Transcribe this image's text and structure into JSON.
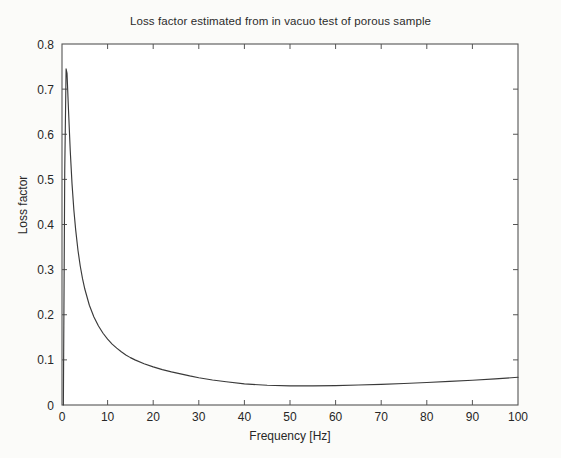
{
  "chart_data": {
    "type": "line",
    "title": "Loss factor estimated from in vacuo test of porous sample",
    "xlabel": "Frequency [Hz]",
    "ylabel": "Loss factor",
    "xlim": [
      0,
      100
    ],
    "ylim": [
      0,
      0.8
    ],
    "grid": false,
    "legend": null,
    "xticks": [
      0,
      10,
      20,
      30,
      40,
      50,
      60,
      70,
      80,
      90,
      100
    ],
    "xtick_labels": [
      "0",
      "10",
      "20",
      "30",
      "40",
      "50",
      "60",
      "70",
      "80",
      "90",
      "100"
    ],
    "yticks": [
      0,
      0.1,
      0.2,
      0.3,
      0.4,
      0.5,
      0.6,
      0.7,
      0.8
    ],
    "ytick_labels": [
      "0",
      "0.1",
      "0.2",
      "0.3",
      "0.4",
      "0.5",
      "0.6",
      "0.7",
      "0.8"
    ],
    "tick_direction": "in",
    "box": true,
    "line_color": "#3a3a3a",
    "series": [
      {
        "name": "Loss factor",
        "x": [
          0.3,
          0.6,
          0.9,
          1.1,
          1.4,
          1.8,
          2.2,
          2.6,
          3.0,
          3.5,
          4.0,
          4.5,
          5.0,
          6.0,
          7.0,
          8.0,
          9.0,
          10.0,
          11.0,
          12.0,
          13.0,
          14.0,
          15.0,
          16.0,
          18.0,
          20.0,
          22.0,
          24.0,
          26.0,
          28.0,
          30.0,
          33.0,
          36.0,
          40.0,
          45.0,
          50.0,
          55.0,
          60.0,
          65.0,
          70.0,
          75.0,
          80.0,
          85.0,
          90.0,
          95.0,
          100.0
        ],
        "y": [
          0.0,
          0.52,
          0.745,
          0.735,
          0.66,
          0.565,
          0.49,
          0.432,
          0.388,
          0.343,
          0.308,
          0.28,
          0.257,
          0.221,
          0.195,
          0.175,
          0.159,
          0.146,
          0.135,
          0.126,
          0.118,
          0.111,
          0.105,
          0.1,
          0.0915,
          0.0845,
          0.0785,
          0.0735,
          0.069,
          0.0645,
          0.0605,
          0.0555,
          0.0515,
          0.0468,
          0.0438,
          0.0425,
          0.0424,
          0.043,
          0.0442,
          0.0458,
          0.0476,
          0.0498,
          0.0522,
          0.0548,
          0.0578,
          0.0615
        ]
      }
    ]
  },
  "figure": {
    "title": "Loss factor estimated from in vacuo test of porous sample",
    "xlabel": "Frequency [Hz]",
    "ylabel": "Loss factor"
  }
}
